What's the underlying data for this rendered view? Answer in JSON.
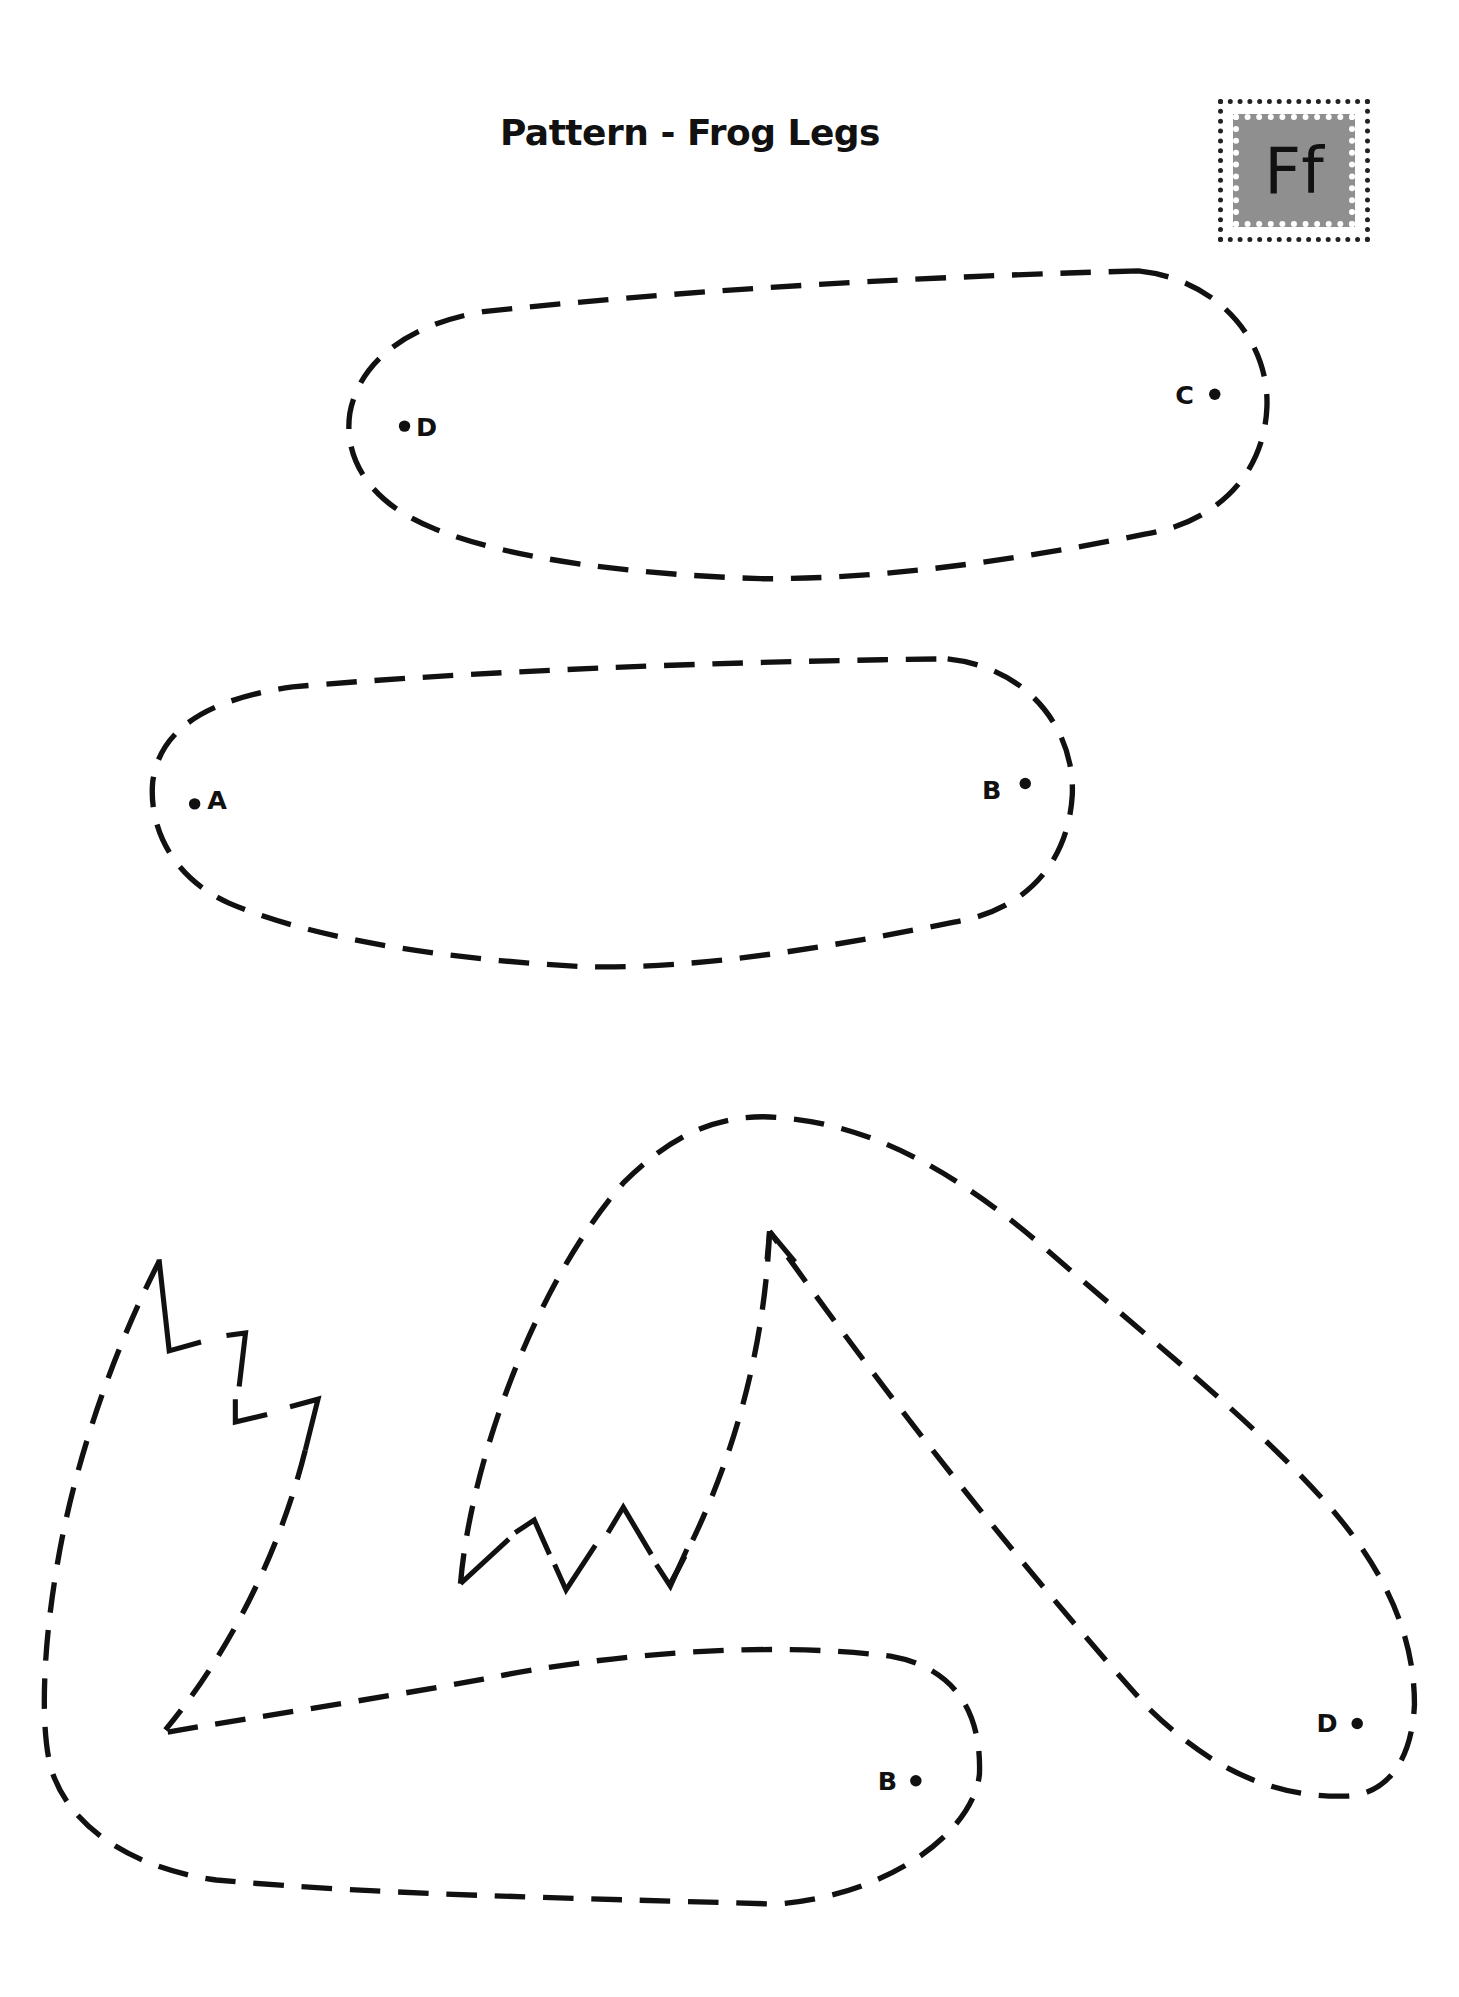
{
  "page": {
    "title": "Pattern - Frog Legs",
    "badge_letter": "Ff"
  },
  "pieces": [
    {
      "name": "upper-leg-piece-1",
      "points": [
        {
          "label": "D",
          "side": "left"
        },
        {
          "label": "C",
          "side": "right"
        }
      ]
    },
    {
      "name": "upper-leg-piece-2",
      "points": [
        {
          "label": "A",
          "side": "left"
        },
        {
          "label": "B",
          "side": "right"
        }
      ]
    },
    {
      "name": "lower-leg-foot-piece-left",
      "points": [
        {
          "label": "B",
          "side": "right"
        }
      ]
    },
    {
      "name": "lower-leg-foot-piece-right",
      "points": [
        {
          "label": "D",
          "side": "right"
        }
      ]
    }
  ],
  "labels": {
    "p1_left": "D",
    "p1_right": "C",
    "p2_left": "A",
    "p2_right": "B",
    "p3_b": "B",
    "p4_d": "D"
  },
  "colors": {
    "ink": "#111111",
    "badge_fill": "#8f8f8f",
    "background": "#ffffff"
  }
}
